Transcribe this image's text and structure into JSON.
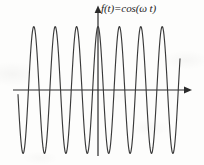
{
  "figure": {
    "name": "cosine-waveform-figure",
    "background_color": "#fdfdfc",
    "stroke_color": "#3a3a3a",
    "axis_color": "#2b2b2b",
    "label": {
      "full_text": "f(t)=cos(ω t)",
      "function_name": "f",
      "variable": "t",
      "equals": "=",
      "trig": "cos",
      "omega": "ω"
    },
    "axes": {
      "horizontal": {
        "name": "time-axis",
        "y_pixel": 90,
        "x_start": 13,
        "x_end": 192,
        "arrow": "right"
      },
      "vertical": {
        "name": "amplitude-axis",
        "x_pixel": 98,
        "y_top": 8,
        "y_bottom": 156,
        "arrow": "up"
      }
    }
  },
  "chart_data": {
    "type": "line",
    "title": "f(t)=cos(ω t)",
    "xlabel": "t",
    "ylabel": "f(t)",
    "legend": [],
    "grid": false,
    "function": "cos",
    "amplitude": 1,
    "cycles_shown": 7.5,
    "period_pixels": 21.4,
    "phase_at_origin": 1,
    "xlim": [
      -4.0,
      3.5
    ],
    "ylim": [
      -1.15,
      1.15
    ],
    "x_domain_pixels": [
      18,
      180
    ],
    "peak_y_pixel": 27,
    "trough_y_pixel": 154,
    "baseline_y_pixel": 90,
    "peaks_x_pixels": [
      35,
      56,
      78,
      99,
      120,
      142,
      163
    ],
    "troughs_x_pixels": [
      24,
      46,
      67,
      88,
      110,
      131,
      152,
      174
    ],
    "series": [
      {
        "name": "cos(ωt)",
        "color": "#3a3a3a",
        "x": [
          -3.75,
          -3.5,
          -3.25,
          -3.0,
          -2.75,
          -2.5,
          -2.25,
          -2.0,
          -1.75,
          -1.5,
          -1.25,
          -1.0,
          -0.75,
          -0.5,
          -0.25,
          0.0,
          0.25,
          0.5,
          0.75,
          1.0,
          1.25,
          1.5,
          1.75,
          2.0,
          2.25,
          2.5,
          2.75,
          3.0,
          3.25,
          3.5
        ],
        "values": [
          -0.707,
          -1.0,
          -0.707,
          0.0,
          0.707,
          1.0,
          0.707,
          0.0,
          -0.707,
          -1.0,
          -0.707,
          0.0,
          0.707,
          1.0,
          0.707,
          1.0,
          0.707,
          1.0,
          0.707,
          0.0,
          -0.707,
          -1.0,
          -0.707,
          0.0,
          0.707,
          1.0,
          0.707,
          0.0,
          -0.707,
          -1.0
        ]
      }
    ]
  }
}
